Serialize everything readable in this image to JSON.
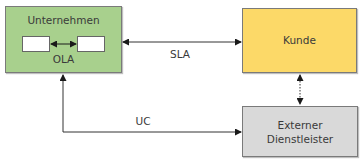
{
  "nodes": {
    "unternehmen": {
      "label": "Unternehmen",
      "inner_label": "OLA",
      "color": "#a8d08d"
    },
    "kunde": {
      "label": "Kunde",
      "color": "#fcd968"
    },
    "dienstleister": {
      "label_line1": "Externer",
      "label_line2": "Dienstleister",
      "color": "#d9d9d9"
    }
  },
  "edges": {
    "sla": {
      "label": "SLA",
      "from": "Unternehmen",
      "to": "Kunde",
      "style": "solid",
      "direction": "both"
    },
    "uc": {
      "label": "UC",
      "from": "Unternehmen",
      "to": "Externer Dienstleister",
      "style": "solid",
      "direction": "both"
    },
    "kunde_dienstleister": {
      "label": "",
      "style": "dotted",
      "direction": "both"
    },
    "ola_internal": {
      "style": "solid",
      "direction": "both"
    }
  }
}
